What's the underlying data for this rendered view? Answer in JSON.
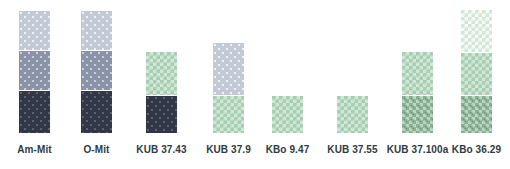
{
  "chart_data": {
    "type": "bar",
    "title": "",
    "subtitle": "",
    "xlabel": "",
    "ylabel": "",
    "grid": false,
    "legend_position": "none",
    "stacked": true,
    "ylim": [
      0,
      123
    ],
    "categories": [
      "Am-Mit",
      "O-Mit",
      "KUB 37.43",
      "KUB 37.9",
      "KBo 9.47",
      "KUB 37.55",
      "KUB 37.100a",
      "KBo 36.29"
    ],
    "series": [
      {
        "name": "bottom",
        "values": [
          43,
          43,
          38,
          38,
          37,
          37,
          38,
          38
        ]
      },
      {
        "name": "middle",
        "values": [
          40,
          40,
          43,
          52,
          0,
          0,
          43,
          43
        ]
      },
      {
        "name": "top",
        "values": [
          39,
          39,
          0,
          0,
          0,
          0,
          0,
          42
        ]
      }
    ],
    "totals": [
      122,
      122,
      81,
      90,
      37,
      37,
      81,
      123
    ],
    "annotations": []
  },
  "chart": {
    "bars": [
      {
        "label": "Am-Mit",
        "left": 19,
        "total_height": 122,
        "segments": [
          {
            "name": "light-gray",
            "pattern": "p-lightgray",
            "color": "#c3c9d6",
            "height": 39
          },
          {
            "name": "mid-blue-gray",
            "pattern": "p-midblue",
            "color": "#8a93a8",
            "height": 40
          },
          {
            "name": "dark-navy",
            "pattern": "p-darknavy",
            "color": "#323747",
            "height": 43
          }
        ]
      },
      {
        "label": "O-Mit",
        "left": 81,
        "total_height": 122,
        "segments": [
          {
            "name": "light-gray",
            "pattern": "p-lightgray",
            "color": "#c3c9d6",
            "height": 39
          },
          {
            "name": "mid-blue-gray",
            "pattern": "p-midblue",
            "color": "#8a93a8",
            "height": 40
          },
          {
            "name": "dark-navy",
            "pattern": "p-darknavy",
            "color": "#323747",
            "height": 43
          }
        ]
      },
      {
        "label": "KUB 37.43",
        "left": 146,
        "total_height": 81,
        "segments": [
          {
            "name": "mid-green",
            "pattern": "p-midgreen",
            "color": "#a5cfb0",
            "height": 43
          },
          {
            "name": "dark-navy",
            "pattern": "p-darknavy",
            "color": "#323747",
            "height": 38
          }
        ]
      },
      {
        "label": "KUB 37.9",
        "left": 213,
        "total_height": 90,
        "segments": [
          {
            "name": "light-gray",
            "pattern": "p-lightgray",
            "color": "#c3c9d6",
            "height": 52
          },
          {
            "name": "mid-green",
            "pattern": "p-midgreen",
            "color": "#a5cfb0",
            "height": 38
          }
        ]
      },
      {
        "label": "KBo 9.47",
        "left": 272,
        "total_height": 37,
        "segments": [
          {
            "name": "mid-green",
            "pattern": "p-midgreen",
            "color": "#a5cfb0",
            "height": 37
          }
        ]
      },
      {
        "label": "KUB 37.55",
        "left": 337,
        "total_height": 37,
        "segments": [
          {
            "name": "mid-green",
            "pattern": "p-midgreen",
            "color": "#a5cfb0",
            "height": 37
          }
        ]
      },
      {
        "label": "KUB 37.100a",
        "left": 402,
        "total_height": 81,
        "segments": [
          {
            "name": "mid-green",
            "pattern": "p-midgreen",
            "color": "#a5cfb0",
            "height": 43
          },
          {
            "name": "dark-green-check",
            "pattern": "p-darkgreen",
            "color": "#86b191",
            "height": 38
          }
        ]
      },
      {
        "label": "KBo 36.29",
        "left": 461,
        "total_height": 123,
        "segments": [
          {
            "name": "pale-green",
            "pattern": "p-palegreen",
            "color": "#d3e7d8",
            "height": 42
          },
          {
            "name": "mid-green",
            "pattern": "p-midgreen",
            "color": "#a5cfb0",
            "height": 43
          },
          {
            "name": "dark-green-check",
            "pattern": "p-darkgreen",
            "color": "#86b191",
            "height": 38
          }
        ]
      }
    ]
  }
}
